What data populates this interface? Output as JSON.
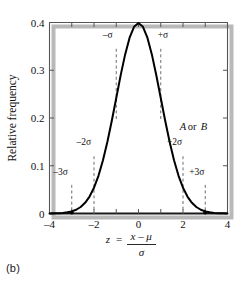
{
  "figure": {
    "caption": "(b)",
    "colors": {
      "curve": "#000000",
      "frame": "#555555",
      "axis_bottom": "#1a1a1a",
      "shadow": "#b9b9b9",
      "dashed": "#6f6f6f",
      "background": "#ffffff"
    }
  },
  "chart_data": {
    "type": "line",
    "title": "",
    "subtitle": "",
    "xlabel": "z = (x − μ) / σ",
    "xlabel_parts": {
      "lhs": "z",
      "equals": "=",
      "numerator_x": "x",
      "numerator_minus": "–",
      "numerator_mu": "μ",
      "denominator": "σ"
    },
    "ylabel": "Relative frequency",
    "xlim": [
      -4,
      4
    ],
    "ylim": [
      0,
      0.4
    ],
    "xticks": [
      -4,
      -3,
      -2,
      -1,
      0,
      1,
      2,
      3,
      4
    ],
    "xticklabels": [
      "–4",
      "",
      "–2",
      "",
      "0",
      "",
      "2",
      "",
      "4"
    ],
    "yticks": [
      0,
      0.1,
      0.2,
      0.3,
      0.4
    ],
    "yticklabels": [
      "0",
      "0.1",
      "0.2",
      "0.3",
      "0.4"
    ],
    "grid": false,
    "legend": null,
    "series": [
      {
        "name": "standard normal density",
        "formula": "phi(z) = 0.3989 * exp(-z^2/2)",
        "x": [
          -4.0,
          -3.8,
          -3.6,
          -3.4,
          -3.2,
          -3.0,
          -2.8,
          -2.6,
          -2.4,
          -2.2,
          -2.0,
          -1.8,
          -1.6,
          -1.4,
          -1.2,
          -1.0,
          -0.8,
          -0.6,
          -0.4,
          -0.2,
          0.0,
          0.2,
          0.4,
          0.6,
          0.8,
          1.0,
          1.2,
          1.4,
          1.6,
          1.8,
          2.0,
          2.2,
          2.4,
          2.6,
          2.8,
          3.0,
          3.2,
          3.4,
          3.6,
          3.8,
          4.0
        ],
        "y": [
          0.0001,
          0.0003,
          0.0006,
          0.0012,
          0.0024,
          0.0044,
          0.0079,
          0.0136,
          0.0224,
          0.0355,
          0.054,
          0.079,
          0.1109,
          0.1497,
          0.1942,
          0.242,
          0.2897,
          0.3332,
          0.3683,
          0.391,
          0.3989,
          0.391,
          0.3683,
          0.3332,
          0.2897,
          0.242,
          0.1942,
          0.1497,
          0.1109,
          0.079,
          0.054,
          0.0355,
          0.0224,
          0.0136,
          0.0079,
          0.0044,
          0.0024,
          0.0012,
          0.0006,
          0.0003,
          0.0001
        ]
      }
    ],
    "annotations": [
      {
        "label": "–σ",
        "x": -1,
        "y_top": 0.345,
        "y_bottom": 0.195,
        "label_x": -1.38,
        "label_y": 0.368
      },
      {
        "label": "+σ",
        "x": 1,
        "y_top": 0.345,
        "y_bottom": 0.195,
        "label_x": 1.1,
        "label_y": 0.368
      },
      {
        "label": "–2σ",
        "x": -2,
        "y_top": 0.12,
        "y_bottom": 0.0,
        "label_x": -2.46,
        "label_y": 0.143
      },
      {
        "label": "+2σ",
        "x": 2,
        "y_top": 0.12,
        "y_bottom": 0.0,
        "label_x": 1.62,
        "label_y": 0.143
      },
      {
        "label": "–3σ",
        "x": -3,
        "y_top": 0.06,
        "y_bottom": 0.0,
        "label_x": -3.5,
        "label_y": 0.081
      },
      {
        "label": "+3σ",
        "x": 3,
        "y_top": 0.06,
        "y_bottom": 0.0,
        "label_x": 2.62,
        "label_y": 0.081
      }
    ],
    "text_annotations": [
      {
        "text_a": "A",
        "text_or": "or",
        "text_b": "B",
        "x": 1.85,
        "y": 0.175
      }
    ]
  }
}
